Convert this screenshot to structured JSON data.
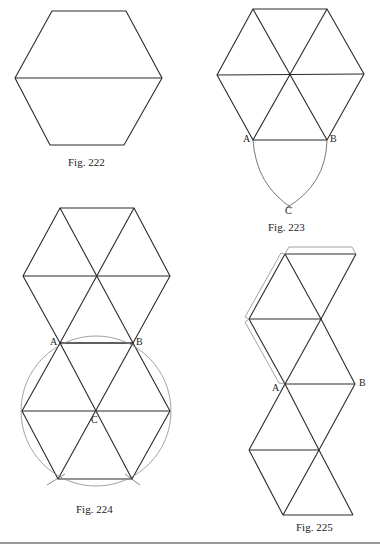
{
  "figures": [
    {
      "id": "222",
      "caption": "Fig. 222",
      "description": "Regular hexagon bisected by a horizontal diagonal"
    },
    {
      "id": "223",
      "caption": "Fig. 223",
      "description": "Hexagon divided into six triangles with arcs from A and B meeting at C",
      "labels": {
        "a": "A",
        "b": "B",
        "c": "C"
      }
    },
    {
      "id": "224",
      "caption": "Fig. 224",
      "description": "Two hexagons of triangles joined, with a circle through A and B centered at C",
      "labels": {
        "a": "A",
        "b": "B",
        "c": "C"
      }
    },
    {
      "id": "225",
      "caption": "Fig. 225",
      "description": "Net of triangles in a zig-zag strip with glue flaps",
      "labels": {
        "a": "A",
        "b": "B"
      }
    }
  ],
  "colors": {
    "line": "#2a2a2a",
    "construction": "#8c8c8c",
    "rule": "#9a9a9a"
  }
}
